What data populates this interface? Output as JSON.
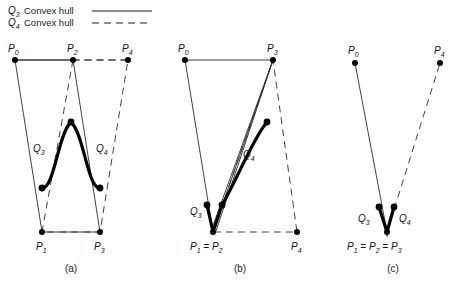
{
  "figure": {
    "caption_a": "(a)",
    "caption_b": "(b)",
    "caption_c": "(c)"
  },
  "legend": {
    "entries": [
      {
        "symbol": "Q",
        "subscript": "3",
        "text": "Convex hull",
        "style": "solid"
      },
      {
        "symbol": "Q",
        "subscript": "4",
        "text": "Convex hull",
        "style": "dashed"
      }
    ]
  },
  "panel_a": {
    "labels": {
      "p0": "P",
      "p0_sub": "0",
      "p1": "P",
      "p1_sub": "1",
      "p2": "P",
      "p2_sub": "2",
      "p3": "P",
      "p3_sub": "3",
      "p4": "P",
      "p4_sub": "4",
      "q3": "Q",
      "q3_sub": "3",
      "q4": "Q",
      "q4_sub": "4"
    },
    "points": {
      "P0": [
        15,
        60
      ],
      "P1": [
        42,
        232
      ],
      "P2": [
        73,
        60
      ],
      "P3": [
        100,
        232
      ],
      "P4": [
        128,
        60
      ]
    },
    "curve_endpoints": [
      [
        42,
        188
      ],
      [
        100,
        188
      ]
    ],
    "curve_peak": [
      71,
      122
    ]
  },
  "panel_b": {
    "labels": {
      "p0": "P",
      "p0_sub": "0",
      "p12": "P",
      "p12_sub1": "1",
      "p12_eq": " = ",
      "p12_sub2": "2",
      "p3": "P",
      "p3_sub": "3",
      "p4": "P",
      "p4_sub": "4",
      "q3": "Q",
      "q3_sub": "3",
      "q4": "Q",
      "q4_sub": "4"
    },
    "points": {
      "P0": [
        185,
        60
      ],
      "P1_P2": [
        213,
        232
      ],
      "P3": [
        273,
        60
      ],
      "P4": [
        297,
        232
      ]
    },
    "q3_segment": [
      [
        207,
        205
      ],
      [
        213,
        232
      ]
    ],
    "q4_endpoint": [
      267,
      122
    ]
  },
  "panel_c": {
    "labels": {
      "p0": "P",
      "p0_sub": "0",
      "p123": "P",
      "p123_sub1": "1",
      "p123_sub2": "2",
      "p123_sub3": "3",
      "p4": "P",
      "p4_sub": "4",
      "q3": "Q",
      "q3_sub": "3",
      "q4": "Q",
      "q4_sub": "4",
      "equals": " = "
    },
    "points": {
      "P0": [
        355,
        63
      ],
      "P1_P2_P3": [
        387,
        232
      ],
      "P4": [
        440,
        63
      ]
    },
    "v_arms": [
      [
        379,
        207
      ],
      [
        394,
        207
      ]
    ]
  },
  "colors": {
    "line": "#2b2b2b",
    "curve": "#000000",
    "text": "#1a1a1a",
    "background": "#ffffff"
  }
}
